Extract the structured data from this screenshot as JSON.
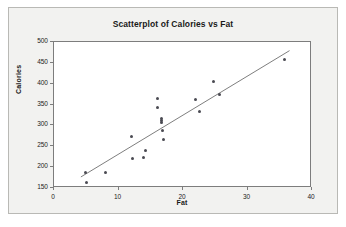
{
  "chart_data": {
    "type": "scatter",
    "title": "Scatterplot of Calories vs Fat",
    "xlabel": "Fat",
    "ylabel": "Calories",
    "xlim": [
      0,
      40
    ],
    "ylim": [
      150,
      500
    ],
    "xticks": [
      0,
      10,
      20,
      30,
      40
    ],
    "yticks": [
      150,
      200,
      250,
      300,
      350,
      400,
      450,
      500
    ],
    "grid": false,
    "legend": null,
    "marker_color": "#4a4a52",
    "line_color": "#6e6e6e",
    "points": [
      {
        "x": 4.9,
        "y": 187
      },
      {
        "x": 5.0,
        "y": 162
      },
      {
        "x": 8.0,
        "y": 187
      },
      {
        "x": 12.0,
        "y": 274
      },
      {
        "x": 12.1,
        "y": 220
      },
      {
        "x": 13.8,
        "y": 224
      },
      {
        "x": 14.2,
        "y": 240
      },
      {
        "x": 16.1,
        "y": 365
      },
      {
        "x": 16.1,
        "y": 342
      },
      {
        "x": 16.6,
        "y": 316
      },
      {
        "x": 16.6,
        "y": 311
      },
      {
        "x": 16.7,
        "y": 306
      },
      {
        "x": 16.8,
        "y": 287
      },
      {
        "x": 16.9,
        "y": 266
      },
      {
        "x": 22.0,
        "y": 363
      },
      {
        "x": 22.6,
        "y": 333
      },
      {
        "x": 24.8,
        "y": 405
      },
      {
        "x": 25.6,
        "y": 374
      },
      {
        "x": 35.7,
        "y": 457
      }
    ],
    "trendline": {
      "type": "linear-fit",
      "x_start": 4.2,
      "y_start": 172,
      "x_end": 36.8,
      "y_end": 479
    }
  }
}
